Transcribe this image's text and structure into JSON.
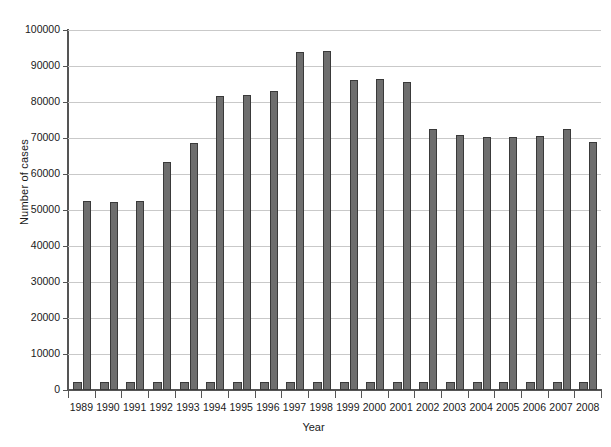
{
  "chart_data": {
    "type": "bar",
    "title": "",
    "xlabel": "Year",
    "ylabel": "Number of cases",
    "ylim": [
      0,
      100000
    ],
    "ytick_labels": [
      "0",
      "10000",
      "20000",
      "30000",
      "40000",
      "50000",
      "60000",
      "70000",
      "80000",
      "90000",
      "100000"
    ],
    "ytick_values": [
      0,
      10000,
      20000,
      30000,
      40000,
      50000,
      60000,
      70000,
      80000,
      90000,
      100000
    ],
    "grid": true,
    "legend": "none",
    "categories": [
      "1989",
      "1990",
      "1991",
      "1992",
      "1993",
      "1994",
      "1995",
      "1996",
      "1997",
      "1998",
      "1999",
      "2000",
      "2001",
      "2002",
      "2003",
      "2004",
      "2005",
      "2006",
      "2007",
      "2008"
    ],
    "series": [
      {
        "name": "small bar",
        "values": [
          2200,
          2200,
          2200,
          2200,
          2200,
          2200,
          2200,
          2200,
          2300,
          2300,
          2200,
          2200,
          2200,
          2200,
          2200,
          2200,
          2200,
          2200,
          2200,
          2200
        ]
      },
      {
        "name": "tall bar",
        "values": [
          52500,
          52200,
          52500,
          63200,
          68700,
          81800,
          82000,
          83000,
          94000,
          94200,
          86200,
          86500,
          85500,
          72500,
          70800,
          70300,
          70300,
          70500,
          72400,
          69000
        ]
      }
    ],
    "bar_color": "#6e6e6e",
    "bar_edge_color": "#3a3a3a",
    "axis_color": "#555555",
    "grid_color": "#c9c9c9",
    "background_color": "#ffffff"
  }
}
